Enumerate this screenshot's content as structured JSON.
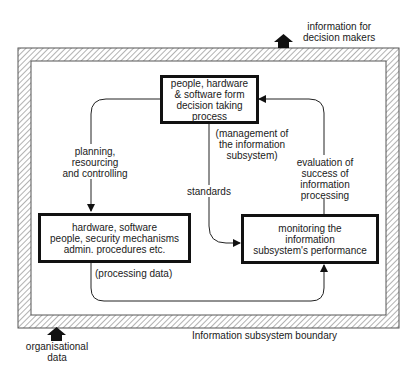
{
  "diagram": {
    "boundary": {
      "label": "Information subsystem boundary",
      "fill_pattern": "diagonal-hatch",
      "line_color": "#444444"
    },
    "inputs": [
      {
        "id": "organisational-data",
        "label": "organisational\ndata",
        "direction": "in"
      }
    ],
    "outputs": [
      {
        "id": "information-for-decision-makers",
        "label": "information for\ndecision makers",
        "direction": "out"
      }
    ],
    "nodes": [
      {
        "id": "decision",
        "label": "people, hardware\n& software form\ndecision taking\nprocess"
      },
      {
        "id": "processing",
        "label": "hardware, software\npeople, security mechanisms\nadmin. procedures etc."
      },
      {
        "id": "monitoring",
        "label": "monitoring the\ninformation\nsubsystem's performance"
      }
    ],
    "edges": [
      {
        "from": "decision",
        "to": "processing",
        "label": "planning,\nresourcing\nand controlling"
      },
      {
        "from": "decision",
        "to": "monitoring",
        "label": "standards"
      },
      {
        "from": "processing",
        "to": "monitoring",
        "label": "(processing data)"
      },
      {
        "from": "monitoring",
        "to": "decision",
        "label": "evaluation of\nsuccess of\ninformation\nprocessing"
      }
    ],
    "annotations": [
      {
        "id": "management",
        "label": "(management of\nthe information\nsubsystem)"
      }
    ]
  }
}
